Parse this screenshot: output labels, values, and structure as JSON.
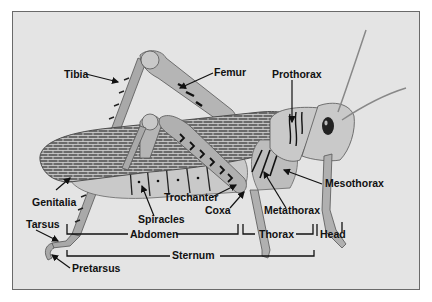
{
  "diagram": {
    "colors": {
      "background": "#e4e4e4",
      "border": "#6a6a6a",
      "body_light": "#c9c9c9",
      "body_mid": "#a9a9a9",
      "wing": "#6b6b6b",
      "ink": "#111111"
    },
    "labels": {
      "tibia": "Tibia",
      "femur": "Femur",
      "prothorax": "Prothorax",
      "mesothorax": "Mesothorax",
      "metathorax": "Metathorax",
      "trochanter": "Trochanter",
      "coxa": "Coxa",
      "spiracles": "Spiracles",
      "genitalia": "Genitalia",
      "tarsus": "Tarsus",
      "pretarsus": "Pretarsus",
      "abdomen": "Abdomen",
      "thorax": "Thorax",
      "head": "Head",
      "sternum": "Sternum"
    }
  }
}
